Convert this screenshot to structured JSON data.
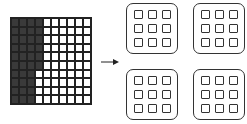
{
  "figure": {
    "hundred_grid": {
      "rows": 10,
      "cols": 10,
      "shaded_count": 36,
      "shaded_pattern": "4 columns shaded in rows 1-6, 3 columns shaded in rows 7-10",
      "shaded_color": "#3a3a3a"
    },
    "arrow": {
      "direction": "right"
    },
    "groups": [
      {
        "label": "group-1",
        "squares": 9
      },
      {
        "label": "group-2",
        "squares": 9
      },
      {
        "label": "group-3",
        "squares": 9
      },
      {
        "label": "group-4",
        "squares": 9
      }
    ]
  }
}
